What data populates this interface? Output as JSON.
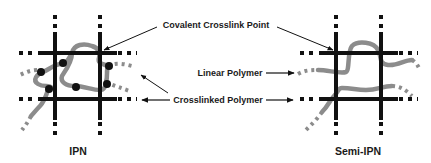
{
  "labels": {
    "covalent_crosslink_point": "Covalent Crosslink Point",
    "linear_polymer": "Linear Polymer",
    "crosslinked_polymer": "Crosslinked Polymer"
  },
  "panels": [
    {
      "id": "ipn",
      "title": "IPN",
      "grid_x": [
        55,
        100
      ],
      "grid_y": [
        53,
        99
      ],
      "has_crosslinked_second_polymer": true
    },
    {
      "id": "semi-ipn",
      "title": "Semi-IPN",
      "grid_x": [
        336,
        381
      ],
      "grid_y": [
        53,
        99
      ],
      "has_crosslinked_second_polymer": false
    }
  ],
  "colors": {
    "network": "#111111",
    "polymer": "#8c8c8c",
    "text": "#1a1a1a",
    "background": "#ffffff"
  }
}
